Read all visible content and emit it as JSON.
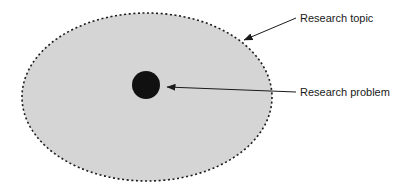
{
  "diagram": {
    "type": "concept-nesting-diagram",
    "background_color": "#ffffff",
    "shapes": {
      "topic_ellipse": {
        "name": "Research topic",
        "fill_color": "#d5d5d5",
        "stroke_color": "#1a1a1a",
        "stroke_style": "dotted",
        "center_x": 147,
        "center_y": 97,
        "radius_x": 125,
        "radius_y": 84
      },
      "problem_circle": {
        "name": "Research problem",
        "fill_color": "#111111",
        "center_x": 146,
        "center_y": 85,
        "radius": 14
      }
    },
    "labels": [
      {
        "id": "research-topic",
        "text": "Research topic",
        "x": 300,
        "y": 19,
        "color": "#1a1a1a"
      },
      {
        "id": "research-problem",
        "text": "Research problem",
        "x": 300,
        "y": 93,
        "color": "#1a1a1a"
      }
    ],
    "connectors": [
      {
        "id": "topic-arrow",
        "from_x": 296,
        "from_y": 18,
        "to_x": 244,
        "to_y": 40,
        "color": "#1a1a1a",
        "arrowhead": "end"
      },
      {
        "id": "problem-arrow",
        "from_x": 296,
        "from_y": 92,
        "to_x": 167,
        "to_y": 87,
        "color": "#1a1a1a",
        "arrowhead": "end"
      }
    ]
  }
}
